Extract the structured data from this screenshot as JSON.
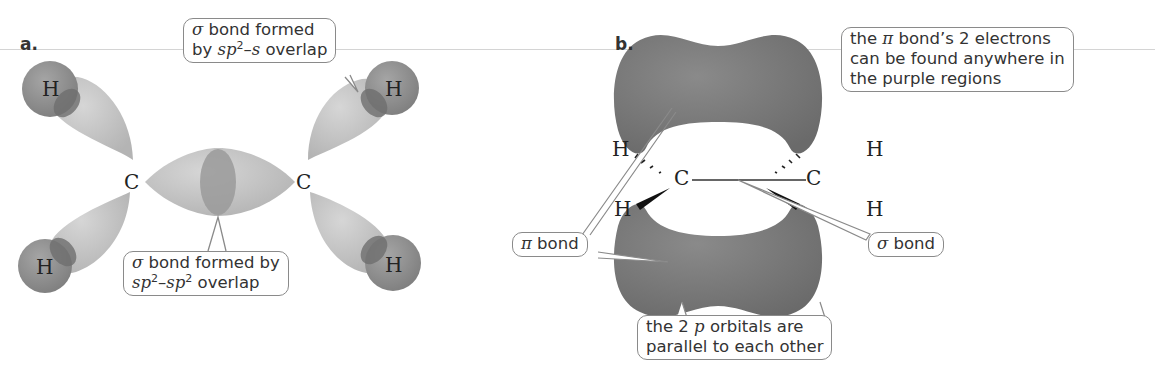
{
  "figure": {
    "panel_a": {
      "label": "a.",
      "atoms": {
        "h_top_left": "H",
        "h_bottom_left": "H",
        "h_top_right": "H",
        "h_bottom_right": "H",
        "c_left": "C",
        "c_right": "C"
      },
      "callout_top": {
        "line1_symbol": "σ",
        "line1_text": " bond formed",
        "line2_prefix": "by ",
        "line2_sp": "sp",
        "line2_sup": "2",
        "line2_dash": "–",
        "line2_s": "s",
        "line2_suffix": " overlap"
      },
      "callout_bottom": {
        "line1_symbol": "σ",
        "line1_text": " bond formed by",
        "line2_sp1": "sp",
        "line2_sup1": "2",
        "line2_dash": "–",
        "line2_sp2": "sp",
        "line2_sup2": "2",
        "line2_suffix": " overlap"
      }
    },
    "panel_b": {
      "label": "b.",
      "atoms": {
        "h_top_left": "H",
        "h_bottom_left": "H",
        "h_top_right": "H",
        "h_bottom_right": "H",
        "c_left": "C",
        "c_right": "C"
      },
      "callout_electrons": {
        "line1_prefix": "the ",
        "line1_symbol": "π",
        "line1_suffix": " bond’s 2 electrons",
        "line2": "can be found anywhere in",
        "line3": "the purple regions"
      },
      "callout_pi": {
        "symbol": "π",
        "text": " bond"
      },
      "callout_sigma": {
        "symbol": "σ",
        "text": " bond"
      },
      "callout_parallel": {
        "line1_prefix": "the 2 ",
        "line1_p": "p",
        "line1_suffix": " orbitals are",
        "line2": "parallel to each other"
      }
    },
    "colors": {
      "sp2_lobe": "#c4c4c4",
      "h_orbital": "#8f8f8f",
      "overlap": "#7a7a7a",
      "pi_cloud": "#7b7b7b",
      "outline": "#8a8a8a"
    }
  }
}
